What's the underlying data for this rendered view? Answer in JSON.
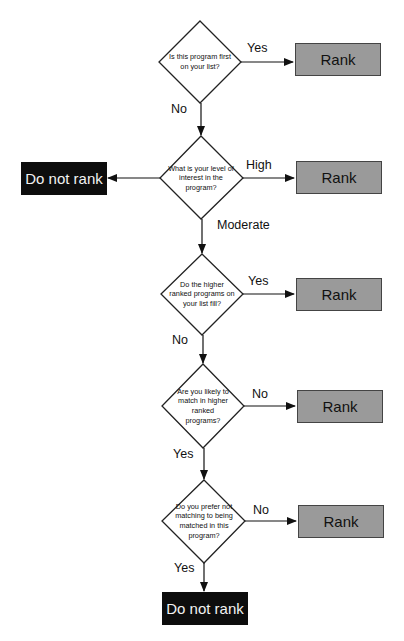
{
  "colors": {
    "rank_fill": "#9a9a9a",
    "rank_border": "#444444",
    "do_not_rank_fill": "#0d0d0d",
    "do_not_rank_text": "#f2f2f2",
    "line": "#111111"
  },
  "questions": [
    {
      "id": "q1",
      "text": "Is this program first on your list?"
    },
    {
      "id": "q2",
      "text": "What is your level of interest in the program?"
    },
    {
      "id": "q3",
      "text": "Do the higher ranked programs on your list fill?"
    },
    {
      "id": "q4",
      "text": "Are you likely to match in higher ranked programs?"
    },
    {
      "id": "q5",
      "text": "Do you prefer not matching to being matched in this program?"
    }
  ],
  "outcomes": {
    "rank": [
      "Rank",
      "Rank",
      "Rank",
      "Rank",
      "Rank"
    ],
    "do_not_rank": [
      "Do not rank",
      "Do not rank"
    ]
  },
  "edge_labels": {
    "q1_right": "Yes",
    "q1_down": "No",
    "q2_right": "High",
    "q2_down": "Moderate",
    "q3_right": "Yes",
    "q3_down": "No",
    "q4_right": "No",
    "q4_down": "Yes",
    "q5_right": "No",
    "q5_down": "Yes"
  }
}
